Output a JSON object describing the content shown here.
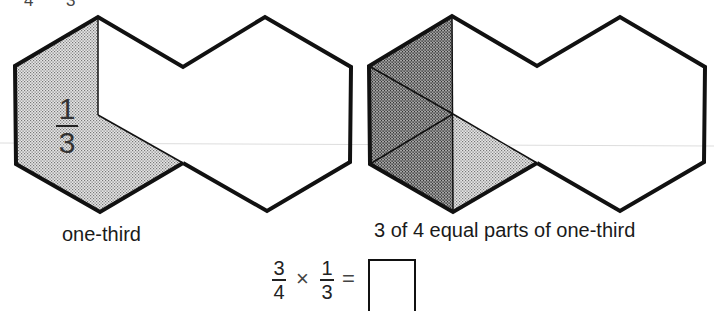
{
  "header_fragment": {
    "left_digit": "4",
    "right_digit": "3"
  },
  "left_figure": {
    "caption": "one-third",
    "fraction": {
      "numerator": "1",
      "denominator": "3"
    }
  },
  "right_figure": {
    "caption": "3 of 4 equal parts of one-third"
  },
  "equation": {
    "a": {
      "numerator": "3",
      "denominator": "4"
    },
    "times": "×",
    "b": {
      "numerator": "1",
      "denominator": "3"
    },
    "equals": "=",
    "answer": ""
  },
  "colors": {
    "outline": "#111111",
    "light_shade": "#c9c9c9",
    "dark_shade": "#8a8a8a"
  }
}
